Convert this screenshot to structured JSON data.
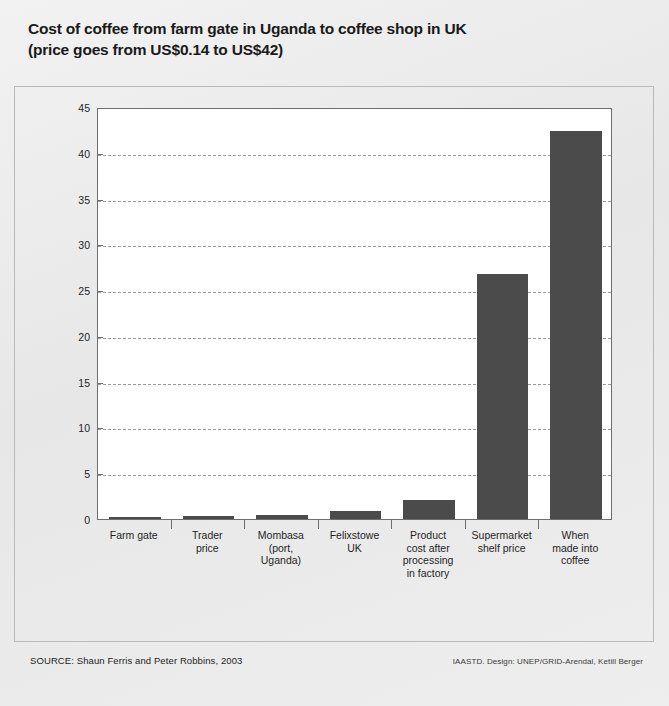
{
  "title": {
    "line1": "Cost of coffee from farm gate in Uganda to coffee shop in UK",
    "line2": "(price goes from US$0.14 to US$42)"
  },
  "footer": {
    "source": "SOURCE: Shaun Ferris and Peter Robbins, 2003",
    "credit": "IAASTD. Design: UNEP/GRID-Arendal, Ketill Berger"
  },
  "style": {
    "bar_color": "#4b4b4b",
    "plot_background": "#ffffff",
    "page_background": "#e9e9e9",
    "grid_color": "#9a9a9a",
    "axis_color": "#6e6e6e"
  },
  "chart_data": {
    "type": "bar",
    "title": "Cost of coffee from farm gate in Uganda to coffee shop in UK (price goes from US$0.14 to US$42)",
    "xlabel": "",
    "ylabel": "",
    "ylim": [
      0,
      45
    ],
    "yticks": [
      0,
      5,
      10,
      15,
      20,
      25,
      30,
      35,
      40,
      45
    ],
    "ytick_labels": [
      "0",
      "5",
      "10",
      "15",
      "20",
      "25",
      "30",
      "35",
      "40",
      "45"
    ],
    "grid": "horizontal-dashed",
    "legend": "none",
    "units": "US$",
    "categories": [
      "Farm gate",
      "Trader price",
      "Mombasa (port, Uganda)",
      "Felixstowe UK",
      "Product cost after processing in factory",
      "Supermarket shelf price",
      "When made into coffee"
    ],
    "category_lines": [
      [
        "Farm gate"
      ],
      [
        "Trader",
        "price"
      ],
      [
        "Mombasa",
        "(port,",
        "Uganda)"
      ],
      [
        "Felixstowe",
        "UK"
      ],
      [
        "Product",
        "cost after",
        "processing",
        "in factory"
      ],
      [
        "Supermarket",
        "shelf price"
      ],
      [
        "When",
        "made into",
        "coffee"
      ]
    ],
    "values": [
      0.14,
      0.3,
      0.45,
      0.85,
      2.1,
      26.8,
      42.4
    ]
  }
}
